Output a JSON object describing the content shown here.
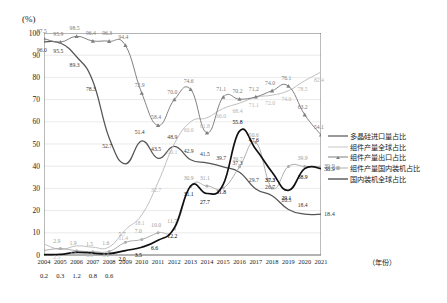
{
  "chart_data": {
    "type": "line",
    "title": "",
    "xlabel": "年份",
    "ylabel": "(%)",
    "ylim": [
      0,
      100
    ],
    "ytick_step": 10,
    "grid": true,
    "legend_position": "right",
    "x": [
      "2004",
      "2005",
      "2006",
      "2007",
      "2008",
      "2009",
      "2010",
      "2011",
      "2012",
      "2013",
      "2014",
      "2015",
      "2016",
      "2017",
      "2018",
      "2019",
      "2020",
      "2021"
    ],
    "yticks": [
      "0",
      "10",
      "20",
      "30",
      "40",
      "50",
      "60",
      "70",
      "80",
      "90",
      "100"
    ],
    "series": [
      {
        "name": "多晶硅进口量占比",
        "color": "#555555",
        "marker": "none",
        "values": [
          96.0,
          95.5,
          89.3,
          78.3,
          52.7,
          41.1,
          51.4,
          43.5,
          48.9,
          42.9,
          41.5,
          39.7,
          37.3,
          29.7,
          26.7,
          20.5,
          18.4,
          18.4
        ],
        "labels": [
          "96.0",
          "95.5",
          "89.3",
          "78.3",
          "52.7",
          "",
          "51.4",
          "43.5",
          "48.9",
          "42.9",
          "41.5",
          "39.7",
          "37.3",
          "29.7",
          "26.7",
          "20.5",
          "18.4",
          ""
        ]
      },
      {
        "name": "组件产量全球占比",
        "color": "#c0c0c0",
        "marker": "none",
        "values": [
          5.0,
          2.5,
          4.1,
          3.5,
          3.6,
          11.4,
          18.1,
          32.7,
          50.1,
          60.0,
          61.8,
          66.0,
          68.4,
          71.1,
          72.0,
          74.0,
          78.5,
          82.4
        ],
        "labels": [
          "",
          "2.5",
          "4.1",
          "3.5",
          "3.6",
          "11.4",
          "18.1",
          "32.7",
          "50.1",
          "60.0",
          "61.8",
          "66.0",
          "68.4",
          "71.1",
          "72.0",
          "74.0",
          "78.5",
          "82.4"
        ]
      },
      {
        "name": "组件产量出口占比",
        "color": "#808080",
        "marker": "triangle",
        "values": [
          97.5,
          95.9,
          98.5,
          96.4,
          96.3,
          94.4,
          72.9,
          58.4,
          70.0,
          74.6,
          55.0,
          71.1,
          70.2,
          71.2,
          74.0,
          76.1,
          63.2,
          54.1
        ],
        "labels": [
          "97.5",
          "95.9",
          "98.5",
          "96.4",
          "96.3",
          "94.4",
          "72.9",
          "58.4",
          "70.0",
          "74.6",
          "",
          "71.1",
          "70.2",
          "71.2",
          "74.0",
          "76.1",
          "63.2",
          "54.1"
        ]
      },
      {
        "name": "组件产量国内装机占比",
        "color": "#adadad",
        "marker": "dot",
        "values": [
          2.0,
          2.9,
          1.9,
          1.5,
          1.6,
          5.7,
          7.0,
          10.0,
          11.7,
          30.9,
          31.1,
          30.2,
          39.7,
          50.6,
          30.2,
          39.9,
          39.9,
          39.9
        ],
        "labels": [
          "",
          "2.9",
          "1.9",
          "1.5",
          "1.6",
          "5.7",
          "7.0",
          "10.0",
          "11.7",
          "30.9",
          "31.1",
          "",
          "39.7",
          "50.6",
          "30.2",
          "",
          "39.9",
          ""
        ]
      },
      {
        "name": "国内装机全球占比",
        "color": "#111111",
        "marker": "none",
        "values": [
          0.2,
          0.3,
          1.2,
          0.8,
          0.6,
          2.0,
          3.5,
          6.6,
          12.2,
          31.1,
          27.7,
          31.8,
          55.8,
          47.6,
          37.3,
          29.1,
          38.9,
          38.9
        ],
        "labels": [
          "",
          "",
          "",
          "",
          "",
          "2.0",
          "3.5",
          "6.6",
          "12.2",
          "31.1",
          "27.7",
          "31.8",
          "55.8",
          "47.6",
          "37.3",
          "29.1",
          "38.9",
          ""
        ]
      }
    ],
    "below_axis_values": [
      "0.2",
      "0.3",
      "1.2",
      "0.8",
      "0.6"
    ]
  },
  "legend": {
    "items": [
      {
        "label": "多晶硅进口量占比"
      },
      {
        "label": "组件产量全球占比"
      },
      {
        "label": "组件产量出口占比"
      },
      {
        "label": "组件产量国内装机占比"
      },
      {
        "label": "国内装机全球占比"
      }
    ]
  },
  "annotations": {
    "right_edge": [
      "39.9",
      "38.9",
      "18.4"
    ]
  }
}
